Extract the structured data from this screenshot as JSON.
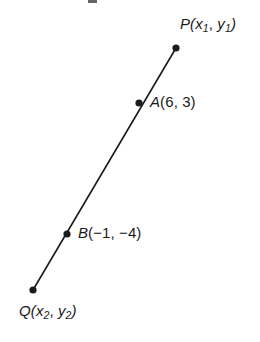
{
  "figure": {
    "width": 260,
    "height": 342,
    "background_color": "#ffffff",
    "stroke_color": "#1b1b1b",
    "line_width": 1.6,
    "dot_radius": 3.6,
    "dot_color": "#1b1b1b"
  },
  "segment": {
    "name": "PQ",
    "from_point": "P",
    "to_point": "Q",
    "x1": 176,
    "y1": 48,
    "x2": 33,
    "y2": 290
  },
  "points": [
    {
      "id": "P",
      "name": "P",
      "cx": 176,
      "cy": 48,
      "label_text": "P(x1, y1)",
      "label_role": "endpoint",
      "label_position": "upper-right",
      "coord_x": "x1",
      "coord_y": "y1"
    },
    {
      "id": "A",
      "name": "A",
      "cx": 139,
      "cy": 103,
      "label_text": "A(6, 3)",
      "label_role": "interior-point",
      "label_position": "right",
      "coord_x": "6",
      "coord_y": "3"
    },
    {
      "id": "B",
      "name": "B",
      "cx": 67,
      "cy": 234,
      "label_text": "B(-1, -4)",
      "label_role": "interior-point",
      "label_position": "right",
      "coord_x": "-1",
      "coord_y": "-4"
    },
    {
      "id": "Q",
      "name": "Q",
      "cx": 33,
      "cy": 290,
      "label_text": "Q(x2, y2)",
      "label_role": "endpoint",
      "label_position": "below",
      "coord_x": "x2",
      "coord_y": "y2"
    }
  ],
  "labels": {
    "P": {
      "letter": "P",
      "open_paren": "(",
      "var_x": "x",
      "sub_x": "1",
      "comma": ", ",
      "var_y": "y",
      "sub_y": "1",
      "close_paren": ")"
    },
    "A": {
      "letter": "A",
      "body": "(6, 3)"
    },
    "B": {
      "letter": "B",
      "body": "(−1, −4)"
    },
    "Q": {
      "letter": "Q",
      "open_paren": "(",
      "var_x": "x",
      "sub_x": "2",
      "comma": ", ",
      "var_y": "y",
      "sub_y": "2",
      "close_paren": ")"
    }
  }
}
